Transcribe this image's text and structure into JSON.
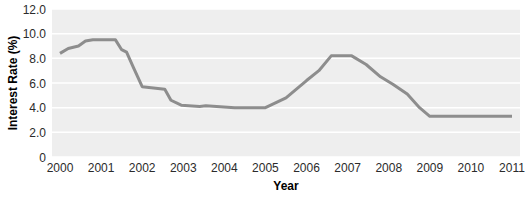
{
  "chart_data": {
    "type": "line",
    "title": "",
    "xlabel": "Year",
    "ylabel": "Interest Rate (%)",
    "xlim": [
      2000,
      2011
    ],
    "ylim": [
      0,
      12
    ],
    "grid": true,
    "legend": false,
    "legend_position": "none",
    "line_color": "#8d8d8d",
    "plot_bg_color": "#eeeeee",
    "gridline_color": "#ffffff",
    "y_ticks": [
      "0",
      "2.0",
      "4.0",
      "6.0",
      "8.0",
      "10.0",
      "12.0"
    ],
    "y_tick_values": [
      0,
      2,
      4,
      6,
      8,
      10,
      12
    ],
    "x_ticks": [
      "2000",
      "2001",
      "2002",
      "2003",
      "2004",
      "2005",
      "2006",
      "2007",
      "2008",
      "2009",
      "2010",
      "2011"
    ],
    "x_tick_values": [
      2000,
      2001,
      2002,
      2003,
      2004,
      2005,
      2006,
      2007,
      2008,
      2009,
      2010,
      2011
    ],
    "series": [
      {
        "name": "Interest Rate",
        "x": [
          2000.0,
          2000.2,
          2000.45,
          2000.62,
          2000.8,
          2001.35,
          2001.5,
          2001.62,
          2001.78,
          2002.0,
          2002.55,
          2002.7,
          2002.95,
          2003.4,
          2003.55,
          2004.25,
          2004.6,
          2005.0,
          2005.5,
          2006.0,
          2006.3,
          2006.6,
          2007.1,
          2007.45,
          2007.8,
          2008.1,
          2008.45,
          2008.75,
          2009.0,
          2010.0,
          2011.0
        ],
        "y": [
          8.4,
          8.8,
          9.0,
          9.4,
          9.5,
          9.5,
          8.7,
          8.5,
          7.3,
          5.7,
          5.5,
          4.6,
          4.2,
          4.1,
          4.15,
          4.0,
          4.0,
          4.0,
          4.8,
          6.2,
          7.0,
          8.2,
          8.2,
          7.5,
          6.5,
          5.9,
          5.1,
          4.0,
          3.3,
          3.3,
          3.3
        ]
      }
    ]
  },
  "axis_titles": {
    "x": "Year",
    "y": "Interest Rate (%)"
  }
}
